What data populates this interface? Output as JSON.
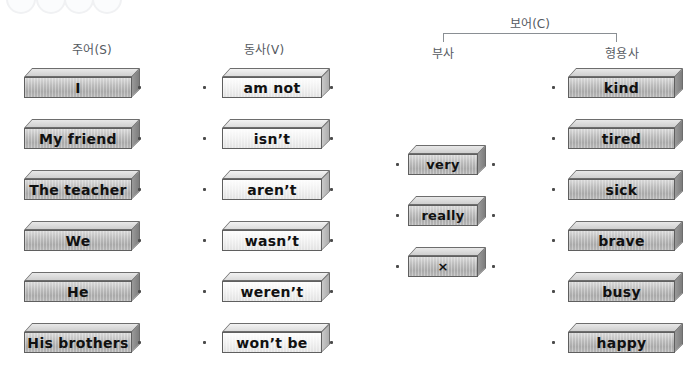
{
  "headings": {
    "subject": "주어(S)",
    "verb": "동사(V)",
    "complement": "보어(C)",
    "adverb": "부사",
    "adjective": "형용사"
  },
  "columns": {
    "subject": {
      "blocks": [
        {
          "label": "I"
        },
        {
          "label": "My friend"
        },
        {
          "label": "The teacher"
        },
        {
          "label": "We"
        },
        {
          "label": "He"
        },
        {
          "label": "His brothers"
        }
      ]
    },
    "verb": {
      "blocks": [
        {
          "label": "am not"
        },
        {
          "label": "isn’t"
        },
        {
          "label": "aren’t"
        },
        {
          "label": "wasn’t"
        },
        {
          "label": "weren’t"
        },
        {
          "label": "won’t be"
        }
      ]
    },
    "adverb": {
      "blocks": [
        {
          "label": "very"
        },
        {
          "label": "really"
        },
        {
          "label": "×"
        }
      ]
    },
    "adjective": {
      "blocks": [
        {
          "label": "kind"
        },
        {
          "label": "tired"
        },
        {
          "label": "sick"
        },
        {
          "label": "brave"
        },
        {
          "label": "busy"
        },
        {
          "label": "happy"
        }
      ]
    }
  },
  "colors": {
    "block_face_gray": "#b6b6b6",
    "block_face_light": "#f2f2f2",
    "block_outline": "#5f5f5f",
    "heading_text": "#555a5f",
    "dot": "#4b4b4b",
    "background": "#ffffff"
  }
}
